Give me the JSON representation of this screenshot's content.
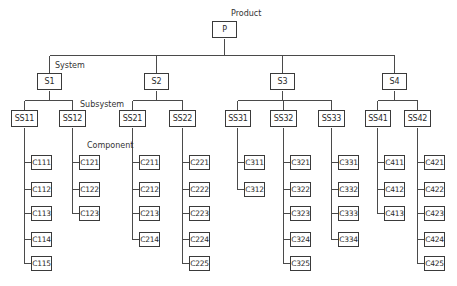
{
  "labels": {
    "product": "Product",
    "system": "System",
    "subsystem": "Subsystem",
    "component": "Component"
  },
  "product": {
    "label": "P"
  },
  "systems": [
    {
      "label": "S1",
      "subsystems": [
        {
          "label": "SS11",
          "components": [
            "C111",
            "C112",
            "C113",
            "C114",
            "C115"
          ]
        },
        {
          "label": "SS12",
          "components": [
            "C121",
            "C122",
            "C123"
          ]
        }
      ]
    },
    {
      "label": "S2",
      "subsystems": [
        {
          "label": "SS21",
          "components": [
            "C211",
            "C212",
            "C213",
            "C214"
          ]
        },
        {
          "label": "SS22",
          "components": [
            "C221",
            "C222",
            "C223",
            "C224",
            "C225"
          ]
        }
      ]
    },
    {
      "label": "S3",
      "subsystems": [
        {
          "label": "SS31",
          "components": [
            "C311",
            "C312"
          ]
        },
        {
          "label": "SS32",
          "components": [
            "C321",
            "C322",
            "C323",
            "C324",
            "C325"
          ]
        },
        {
          "label": "SS33",
          "components": [
            "C331",
            "C332",
            "C333",
            "C334"
          ]
        }
      ]
    },
    {
      "label": "S4",
      "subsystems": [
        {
          "label": "SS41",
          "components": [
            "C411",
            "C412",
            "C413"
          ]
        },
        {
          "label": "SS42",
          "components": [
            "C421",
            "C422",
            "C423",
            "C424",
            "C425"
          ]
        }
      ]
    }
  ],
  "colors": {
    "line": "#4a4a4a",
    "box_border": "#3a3a3a",
    "text": "#2a2a2a"
  }
}
